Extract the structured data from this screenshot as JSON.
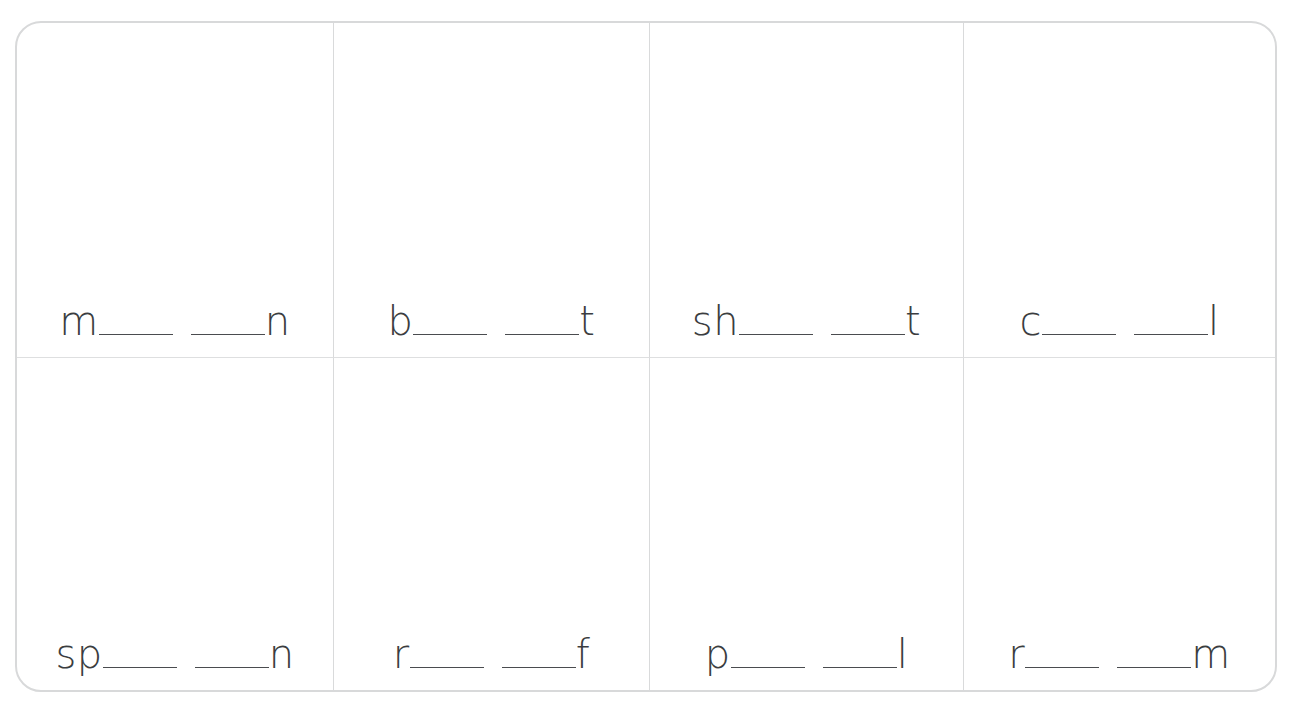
{
  "worksheet": {
    "type": "phonics-word-building-grid",
    "columns": 4,
    "rows": 2,
    "text_color": "#3b3d40",
    "frame_color": "#d8d9da",
    "divider_color": "#d9dadb",
    "blank_line_color": "#4a4c4f",
    "cells": [
      {
        "id": "cell-1",
        "onset": "m",
        "coda": "n",
        "blanks": 2
      },
      {
        "id": "cell-2",
        "onset": "b",
        "coda": "t",
        "blanks": 2
      },
      {
        "id": "cell-3",
        "onset": "sh",
        "coda": "t",
        "blanks": 2
      },
      {
        "id": "cell-4",
        "onset": "c",
        "coda": "l",
        "blanks": 2
      },
      {
        "id": "cell-5",
        "onset": "sp",
        "coda": "n",
        "blanks": 2
      },
      {
        "id": "cell-6",
        "onset": "r",
        "coda": "f",
        "blanks": 2
      },
      {
        "id": "cell-7",
        "onset": "p",
        "coda": "l",
        "blanks": 2
      },
      {
        "id": "cell-8",
        "onset": "r",
        "coda": "m",
        "blanks": 2
      }
    ]
  }
}
